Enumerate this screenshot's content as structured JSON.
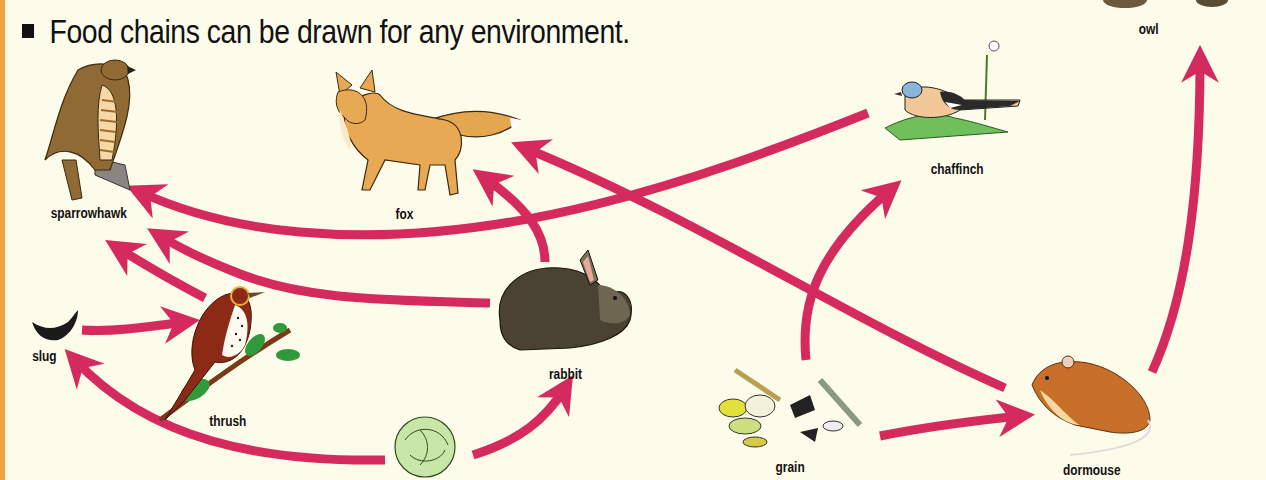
{
  "heading": {
    "text": "Food chains can be drawn for any environment."
  },
  "colors": {
    "background": "#fdfbe9",
    "arrow": "#d42a5e",
    "side_bar": "#f0a040"
  },
  "organisms": {
    "owl": "owl",
    "sparrowhawk": "sparrowhawk",
    "fox": "fox",
    "chaffinch": "chaffinch",
    "slug": "slug",
    "thrush": "thrush",
    "rabbit": "rabbit",
    "cabbage": "",
    "grain": "grain",
    "dormouse": "dormouse"
  },
  "links": [
    {
      "from": "chaffinch",
      "to": "sparrowhawk"
    },
    {
      "from": "rabbit",
      "to": "sparrowhawk"
    },
    {
      "from": "thrush",
      "to": "sparrowhawk"
    },
    {
      "from": "rabbit",
      "to": "fox"
    },
    {
      "from": "dormouse",
      "to": "fox"
    },
    {
      "from": "slug",
      "to": "thrush"
    },
    {
      "from": "cabbage",
      "to": "slug"
    },
    {
      "from": "cabbage",
      "to": "rabbit"
    },
    {
      "from": "grain",
      "to": "chaffinch"
    },
    {
      "from": "grain",
      "to": "dormouse"
    },
    {
      "from": "dormouse",
      "to": "owl"
    }
  ]
}
